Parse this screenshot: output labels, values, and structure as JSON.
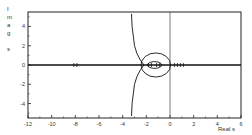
{
  "chart_data": {
    "type": "line",
    "title": "",
    "subtitle": "Root locus plot",
    "xlabel": "Real s",
    "ylabel": "Imag s",
    "ylabel_letters": [
      "I",
      "m",
      "a",
      "g",
      "",
      "s"
    ],
    "xlim": [
      -12,
      6
    ],
    "ylim": [
      -5.5,
      5.5
    ],
    "xticks": [
      -12,
      -10,
      -8,
      -6,
      -4,
      -2,
      0,
      2,
      4,
      6
    ],
    "yticks": [
      -4,
      -2,
      0,
      2,
      4
    ],
    "grid": false,
    "legend": "none",
    "reference_lines": {
      "x": 0,
      "y": 0
    },
    "series": [
      {
        "name": "asymptotic-branch-upper",
        "points": [
          [
            -2.2,
            0
          ],
          [
            -2.5,
            0.5
          ],
          [
            -2.8,
            1.2
          ],
          [
            -3.0,
            2.0
          ],
          [
            -3.1,
            3.0
          ],
          [
            -3.2,
            4.0
          ],
          [
            -3.25,
            5.3
          ]
        ]
      },
      {
        "name": "asymptotic-branch-lower",
        "points": [
          [
            -2.2,
            0
          ],
          [
            -2.5,
            -0.5
          ],
          [
            -2.8,
            -1.2
          ],
          [
            -3.0,
            -2.0
          ],
          [
            -3.1,
            -3.0
          ],
          [
            -3.2,
            -4.0
          ],
          [
            -3.25,
            -5.3
          ]
        ]
      },
      {
        "name": "outer-circle",
        "center": [
          -1.2,
          0
        ],
        "radius": 1.25
      },
      {
        "name": "inner-loop",
        "center": [
          -1.3,
          0
        ],
        "rx": 0.6,
        "ry": 0.35
      },
      {
        "name": "real-axis-locus",
        "points": [
          [
            -12,
            0
          ],
          [
            6,
            0
          ]
        ]
      }
    ],
    "markers": [
      {
        "type": "pole",
        "x": -8.0,
        "y": 0
      },
      {
        "type": "pole",
        "x": -1.7,
        "y": 0
      },
      {
        "type": "pole",
        "x": -1.0,
        "y": 0
      },
      {
        "type": "pole",
        "x": 0.5,
        "y": 0
      },
      {
        "type": "pole",
        "x": 1.0,
        "y": 0
      }
    ]
  }
}
